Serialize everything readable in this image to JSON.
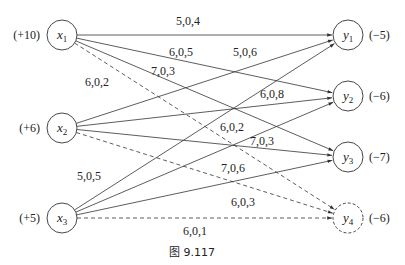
{
  "figure": {
    "caption": "图 9.117",
    "sources": [
      {
        "id": "x1",
        "letter": "x",
        "sub": "1",
        "supply": "(+10)",
        "cx": 62,
        "cy": 35,
        "dashed": false
      },
      {
        "id": "x2",
        "letter": "x",
        "sub": "2",
        "supply": "(+6)",
        "cx": 62,
        "cy": 128,
        "dashed": false
      },
      {
        "id": "x3",
        "letter": "x",
        "sub": "3",
        "supply": "(+5)",
        "cx": 62,
        "cy": 218,
        "dashed": false
      }
    ],
    "sinks": [
      {
        "id": "y1",
        "letter": "y",
        "sub": "1",
        "demand": "(−5)",
        "cx": 348,
        "cy": 35,
        "dashed": false
      },
      {
        "id": "y2",
        "letter": "y",
        "sub": "2",
        "demand": "(−6)",
        "cx": 348,
        "cy": 96,
        "dashed": false
      },
      {
        "id": "y3",
        "letter": "y",
        "sub": "3",
        "demand": "(−7)",
        "cx": 348,
        "cy": 157,
        "dashed": false
      },
      {
        "id": "y4",
        "letter": "y",
        "sub": "4",
        "demand": "(−6)",
        "cx": 348,
        "cy": 218,
        "dashed": true
      }
    ],
    "edges": [
      {
        "from": "x1",
        "to": "y1",
        "label": "5,0,4",
        "dashed": false,
        "lx": 188,
        "ly": 25
      },
      {
        "from": "x1",
        "to": "y2",
        "label": "6,0,5",
        "dashed": false,
        "lx": 181,
        "ly": 56
      },
      {
        "from": "x1",
        "to": "y3",
        "label": "7,0,3",
        "dashed": false,
        "lx": 163,
        "ly": 75
      },
      {
        "from": "x1",
        "to": "y4",
        "label": "6,0,2",
        "dashed": true,
        "lx": 97,
        "ly": 86
      },
      {
        "from": "x2",
        "to": "y1",
        "label": "5,0,6",
        "dashed": false,
        "lx": 245,
        "ly": 56
      },
      {
        "from": "x2",
        "to": "y2",
        "label": "6,0,8",
        "dashed": false,
        "lx": 272,
        "ly": 98
      },
      {
        "from": "x2",
        "to": "y3",
        "label": "7,0,3",
        "dashed": false,
        "lx": 262,
        "ly": 145
      },
      {
        "from": "x2",
        "to": "y4",
        "label": "6,0,3",
        "dashed": true,
        "lx": 243,
        "ly": 206
      },
      {
        "from": "x3",
        "to": "y1",
        "label": "5,0,5",
        "dashed": false,
        "lx": 89,
        "ly": 180
      },
      {
        "from": "x3",
        "to": "y2",
        "label": "6,0,2",
        "dashed": false,
        "lx": 232,
        "ly": 131
      },
      {
        "from": "x3",
        "to": "y3",
        "label": "7,0,6",
        "dashed": false,
        "lx": 233,
        "ly": 172
      },
      {
        "from": "x3",
        "to": "y4",
        "label": "6,0,1",
        "dashed": true,
        "lx": 195,
        "ly": 235
      }
    ],
    "colors": {
      "stroke": "#333333",
      "text": "#222222",
      "background": "#ffffff"
    }
  }
}
